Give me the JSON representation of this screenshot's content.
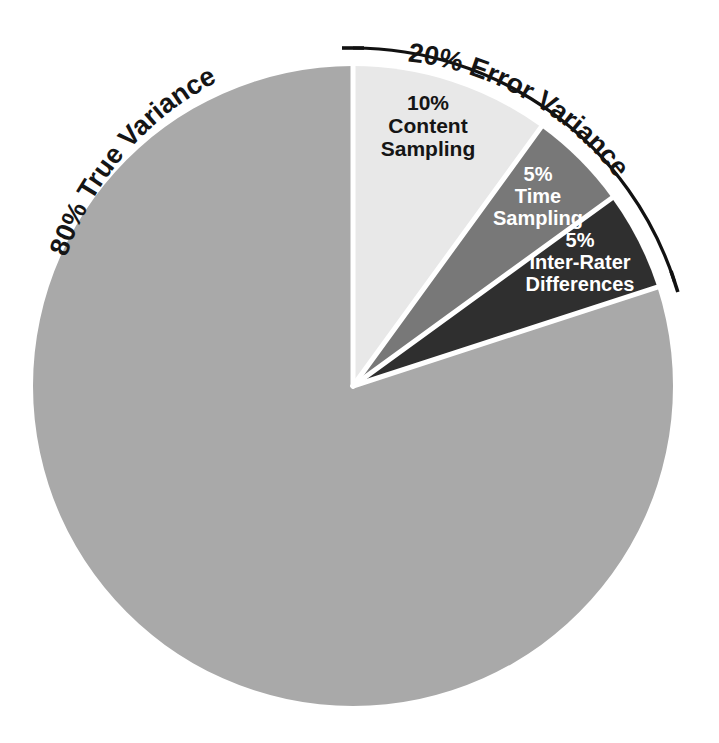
{
  "chart_data": {
    "type": "pie",
    "title": "",
    "subtitle": "",
    "xlabel": "",
    "ylabel": "",
    "legend_position": "none",
    "grid": false,
    "total": 100,
    "units": "percent",
    "start_angle_deg": -90,
    "direction": "counterclockwise",
    "categories": [
      "True Variance",
      "Content Sampling",
      "Time Sampling",
      "Inter-Rater Differences"
    ],
    "values": [
      80,
      10,
      5,
      5
    ],
    "colors": [
      "#a9a9a9",
      "#e8e8e8",
      "#787878",
      "#2f2f2f"
    ],
    "slices": [
      {
        "name": "true-variance",
        "percent_label": "80%",
        "label": "80% True Variance",
        "value": 80,
        "color": "#a9a9a9",
        "label_placement": "outside-curved",
        "label_color": "#151515"
      },
      {
        "name": "content-sampling",
        "percent_label": "10%",
        "label_line1": "10%",
        "label_line2": "Content",
        "label_line3": "Sampling",
        "value": 10,
        "color": "#e8e8e8",
        "label_placement": "inside",
        "label_color": "#151515"
      },
      {
        "name": "time-sampling",
        "percent_label": "5%",
        "label_line1": "5%",
        "label_line2": "Time",
        "label_line3": "Sampling",
        "value": 5,
        "color": "#787878",
        "label_placement": "inside",
        "label_color": "#ffffff"
      },
      {
        "name": "inter-rater-differences",
        "percent_label": "5%",
        "label_line1": "5%",
        "label_line2": "Inter-Rater",
        "label_line3": "Differences",
        "value": 5,
        "color": "#2f2f2f",
        "label_placement": "inside",
        "label_color": "#ffffff"
      }
    ],
    "annotations": [
      {
        "name": "error-variance-bracket",
        "text": "20% Error Variance",
        "covers": [
          "Content Sampling",
          "Time Sampling",
          "Inter-Rater Differences"
        ],
        "value": 20,
        "style": "curved-arc-bracket-with-end-ticks",
        "color": "#111111"
      }
    ]
  },
  "labels": {
    "true_variance": "80% True Variance",
    "error_variance": "20% Error Variance",
    "content_sampling_pct": "10%",
    "content_sampling_l1": "Content",
    "content_sampling_l2": "Sampling",
    "time_sampling_pct": "5%",
    "time_sampling_l1": "Time",
    "time_sampling_l2": "Sampling",
    "inter_rater_pct": "5%",
    "inter_rater_l1": "Inter-Rater",
    "inter_rater_l2": "Differences"
  }
}
